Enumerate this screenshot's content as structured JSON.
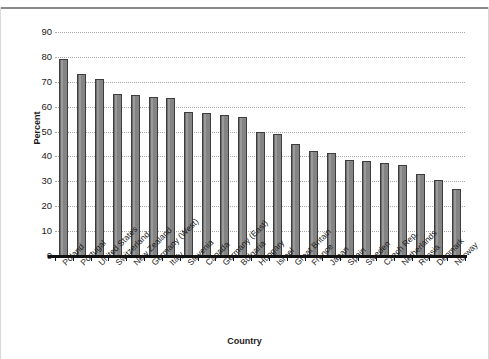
{
  "chart_data": {
    "type": "bar",
    "title": "",
    "xlabel": "Country",
    "ylabel": "Percent",
    "ylim": [
      0,
      90
    ],
    "yticks": [
      0,
      10,
      20,
      30,
      40,
      50,
      60,
      70,
      80,
      90
    ],
    "grid": true,
    "grid_style": "dotted-horizontal",
    "legend": null,
    "categories": [
      "Poland",
      "Portugal",
      "United States",
      "Switzerland",
      "New Zealand",
      "Germany (West)",
      "Italy",
      "Slovenia",
      "Canada",
      "Germany (East)",
      "Bulgaria",
      "Hungary",
      "Israel",
      "Great Britain",
      "France",
      "Japan",
      "Spain",
      "Sweden",
      "Czech Rep.",
      "Netherlands",
      "Russia",
      "Denmark",
      "Norway"
    ],
    "values": [
      79,
      73,
      71,
      65,
      64.5,
      64,
      63.5,
      58,
      57.5,
      56.5,
      56,
      50,
      49,
      45,
      42,
      41.5,
      38.5,
      38,
      37.5,
      36.5,
      33,
      30.5,
      27
    ],
    "bar_color": "#848484",
    "bar_edge_color": "#3d3d3d"
  },
  "axes": {
    "y_title": "Percent",
    "x_title": "Country"
  }
}
